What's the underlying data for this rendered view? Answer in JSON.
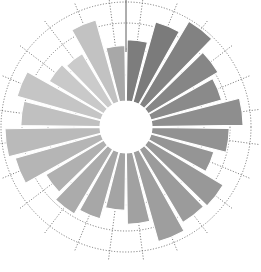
{
  "figure": {
    "title": "",
    "background_color": "#ffffff",
    "width": 261,
    "height": 272
  },
  "chart_data": {
    "type": "bar",
    "subtype": "polar-rose",
    "title": "",
    "subtitle": "",
    "xlabel": "",
    "ylabel": "",
    "grid": true,
    "grid_style": "dotted",
    "legend_position": "none",
    "annotations": [],
    "polar": {
      "center_x": 126,
      "center_y": 127,
      "inner_radius": 26,
      "max_radius": 125,
      "start_angle_deg": 0,
      "direction": "clockwise",
      "sector_count": 24,
      "sector_width_deg": 15,
      "bar_pad_deg": 1.6,
      "grid_circle_radii": [
        52,
        78,
        104,
        125
      ],
      "grid_spoke_count": 24,
      "axis_tick_top": true
    },
    "categories": [
      "s01",
      "s02",
      "s03",
      "s04",
      "s05",
      "s06",
      "s07",
      "s08",
      "s09",
      "s10",
      "s11",
      "s12",
      "s13",
      "s14",
      "s15",
      "s16",
      "s17",
      "s18",
      "s19",
      "s20",
      "s21",
      "s22",
      "s23",
      "s24"
    ],
    "tick_labels": [],
    "ylim": [
      0,
      100
    ],
    "values": [
      62,
      84,
      98,
      82,
      74,
      92,
      78,
      66,
      88,
      86,
      94,
      72,
      58,
      70,
      76,
      68,
      90,
      96,
      80,
      88,
      64,
      60,
      86,
      56
    ],
    "colors": [
      "#7d7d7d",
      "#7b7b7b",
      "#828282",
      "#868686",
      "#8a8a8a",
      "#8e8e8e",
      "#929292",
      "#959595",
      "#989898",
      "#9b9b9b",
      "#9e9e9e",
      "#a1a1a1",
      "#a4a4a4",
      "#a7a7a7",
      "#ababab",
      "#b0b0b0",
      "#b5b5b5",
      "#bababa",
      "#c0c0c0",
      "#c5c5c5",
      "#c9c9c9",
      "#cbcbcb",
      "#c2c2c2",
      "#a8a8a8"
    ],
    "palette_note": "monochrome grey gradient, dark at right, light at upper-left",
    "accent_color": "#808080",
    "grid_color": "#5a5a5a",
    "separator_color": "#ffffff"
  }
}
